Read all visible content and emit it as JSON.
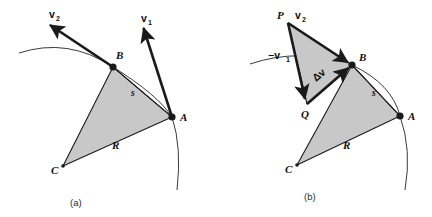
{
  "figure": {
    "colors": {
      "stroke": "#1a1a1a",
      "fill_gray": "#c8c8c8",
      "arc": "#3a3a3a",
      "background": "#ffffff"
    },
    "panels": [
      {
        "id": "a",
        "caption": "(a)",
        "caption_pos": [
          76,
          205
        ],
        "vertices": {
          "A": {
            "label": "A",
            "x": 172,
            "y": 117,
            "label_x": 180,
            "label_y": 119
          },
          "B": {
            "label": "B",
            "x": 113,
            "y": 67,
            "label_x": 116,
            "label_y": 59
          },
          "C": {
            "label": "C",
            "x": 63,
            "y": 166,
            "label_x": 52,
            "label_y": 172
          }
        },
        "edge_labels": [
          {
            "name": "R",
            "text": "R",
            "x": 113,
            "y": 148
          },
          {
            "name": "s",
            "text": "s",
            "x": 131,
            "y": 95
          }
        ],
        "vectors": [
          {
            "name": "v1",
            "label": "v",
            "subscript": "1",
            "from": [
              172,
              117
            ],
            "to": [
              142,
              24
            ],
            "label_x": 143,
            "label_y": 20,
            "sub_x": 151,
            "sub_y": 23
          },
          {
            "name": "v2",
            "label": "v",
            "subscript": "2",
            "from": [
              113,
              67
            ],
            "to": [
              47,
              22
            ],
            "label_x": 52,
            "label_y": 17,
            "sub_x": 60,
            "sub_y": 20
          }
        ],
        "trajectory": {
          "name": "trajectory-arc",
          "path": "M 19 53 Q 68 37 113 67 Q 158 95 172 117 Q 182 147 177 190"
        }
      },
      {
        "id": "b",
        "caption": "(b)",
        "caption_pos": [
          310,
          199
        ],
        "vertices": {
          "A": {
            "label": "A",
            "x": 400,
            "y": 116,
            "label_x": 408,
            "label_y": 118
          },
          "B": {
            "label": "B",
            "x": 352,
            "y": 65,
            "label_x": 359,
            "label_y": 59
          },
          "C": {
            "label": "C",
            "x": 297,
            "y": 165,
            "label_x": 286,
            "label_y": 171
          },
          "P": {
            "label": "P",
            "x": 288,
            "y": 23,
            "label_x": 279,
            "label_y": 18
          },
          "Q": {
            "label": "Q",
            "x": 307,
            "y": 104,
            "label_x": 303,
            "label_y": 116
          }
        },
        "edge_labels": [
          {
            "name": "R",
            "text": "R",
            "x": 344,
            "y": 148
          },
          {
            "name": "s",
            "text": "s",
            "x": 372,
            "y": 95
          }
        ],
        "vectors": [
          {
            "name": "neg-v1",
            "label": "−v",
            "subscript": "1",
            "from": [
              288,
              23
            ],
            "to": [
              307,
              104
            ],
            "label_x": 272,
            "label_y": 58,
            "sub_x": 289,
            "sub_y": 61
          },
          {
            "name": "v2",
            "label": "v",
            "subscript": "2",
            "from": [
              288,
              23
            ],
            "to": [
              352,
              65
            ],
            "label_x": 298,
            "label_y": 18,
            "sub_x": 306,
            "sub_y": 21
          },
          {
            "name": "delta-v",
            "label": "Δv",
            "subscript": "",
            "from": [
              307,
              104
            ],
            "to": [
              352,
              65
            ],
            "label_x": 318,
            "label_y": 80,
            "sub_x": 0,
            "sub_y": 0
          }
        ],
        "trajectory": {
          "name": "trajectory-arc",
          "path": "M 250 64 Q 300 47 352 65 Q 392 84 400 116 Q 412 150 405 190"
        }
      }
    ]
  }
}
